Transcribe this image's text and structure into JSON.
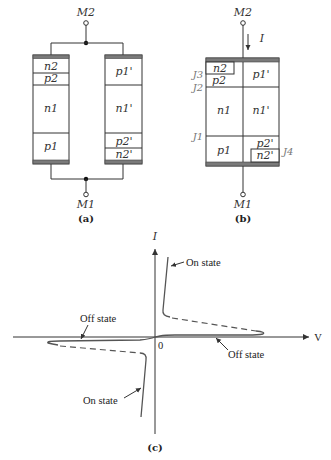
{
  "figure_a": {
    "caption": "(a)",
    "terminal_top": "M2",
    "terminal_bottom": "M1",
    "left_thyristor_layers": [
      "n2",
      "p2",
      "n1",
      "p1"
    ],
    "right_thyristor_layers": [
      "p1'",
      "n1'",
      "p2'",
      "n2'"
    ]
  },
  "figure_b": {
    "caption": "(b)",
    "terminal_top": "M2",
    "terminal_bottom": "M1",
    "current_label": "I",
    "regions": {
      "n2": "n2",
      "p2": "p2",
      "n1": "n1",
      "p1": "p1",
      "p1p": "p1'",
      "n1p": "n1'",
      "p2p": "p2'",
      "n2p": "n2'"
    },
    "junctions": {
      "j1": "J1",
      "j2": "J2",
      "j3": "J3",
      "j4": "J4"
    }
  },
  "figure_c": {
    "caption": "(c)",
    "y_axis_label": "I",
    "x_axis_label": "V",
    "origin_label": "0",
    "annotations": {
      "on_state_upper": "On state",
      "on_state_lower": "On state",
      "off_state_left": "Off state",
      "off_state_right": "Off state"
    }
  },
  "colors": {
    "line": "#333333",
    "contact_bar": "#7a7a7a",
    "junction_label": "#777777",
    "curve": "#555555"
  }
}
